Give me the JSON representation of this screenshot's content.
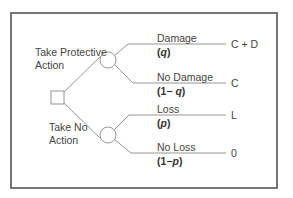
{
  "diagram": {
    "type": "decision-tree",
    "decision_node": {
      "shape": "square",
      "branches": [
        {
          "label_line1": "Take Protective",
          "label_line2": "Action",
          "chance_node": {
            "shape": "circle",
            "outcomes": [
              {
                "event": "Damage",
                "prob_open": "(",
                "prob_prefix": "",
                "prob_var": "q",
                "prob_close": ")",
                "payoff": "C + D"
              },
              {
                "event": "No Damage",
                "prob_open": "(",
                "prob_prefix": "1− ",
                "prob_var": "q",
                "prob_close": ")",
                "payoff": "C"
              }
            ]
          }
        },
        {
          "label_line1": "Take No",
          "label_line2": "Action",
          "chance_node": {
            "shape": "circle",
            "outcomes": [
              {
                "event": "Loss",
                "prob_open": "(",
                "prob_prefix": "",
                "prob_var": "p",
                "prob_close": ")",
                "payoff": "L"
              },
              {
                "event": "No Loss",
                "prob_open": "(",
                "prob_prefix": "1−",
                "prob_var": "p",
                "prob_close": ")",
                "payoff": "0"
              }
            ]
          }
        }
      ]
    }
  }
}
